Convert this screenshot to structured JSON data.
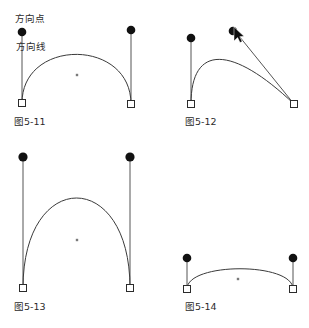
{
  "figure": {
    "background_color": "#ffffff",
    "width": 309,
    "height": 328,
    "colors": {
      "curve": "#3a3a3a",
      "handle_line": "#555555",
      "direction_point": "#111111",
      "anchor_square_fill": "#ffffff",
      "anchor_square_stroke": "#2b2b2b",
      "center_dot": "#7a7a7a",
      "text": "#2b2b2b"
    },
    "annotations": {
      "direction_point_label": "方向点",
      "direction_line_label": "方向线"
    },
    "panels": [
      {
        "id": "panel-5-11",
        "caption": "图5-11",
        "caption_x": 14,
        "caption_y": 125,
        "anchors": [
          {
            "name": "left-anchor",
            "x": 22,
            "y": 103
          },
          {
            "name": "right-anchor",
            "x": 131,
            "y": 104
          }
        ],
        "direction_points": [
          {
            "name": "left-direction-point",
            "x": 22,
            "y": 32
          },
          {
            "name": "right-direction-point",
            "x": 131,
            "y": 30
          }
        ],
        "handles": [
          {
            "x1": 22,
            "y1": 103,
            "x2": 22,
            "y2": 32
          },
          {
            "x1": 131,
            "y1": 104,
            "x2": 131,
            "y2": 30
          }
        ],
        "curve": "M 22 103 C 22 38 131 38 131 104",
        "center_dot": {
          "x": 77,
          "y": 75
        },
        "has_cursor": false
      },
      {
        "id": "panel-5-12",
        "caption": "图5-12",
        "caption_x": 185,
        "caption_y": 125,
        "anchors": [
          {
            "name": "left-anchor",
            "x": 191,
            "y": 104
          },
          {
            "name": "right-anchor",
            "x": 294,
            "y": 104
          }
        ],
        "direction_points": [
          {
            "name": "left-direction-point",
            "x": 191,
            "y": 38
          },
          {
            "name": "right-direction-point",
            "x": 235,
            "y": 31
          }
        ],
        "handles": [
          {
            "x1": 191,
            "y1": 104,
            "x2": 191,
            "y2": 38
          },
          {
            "x1": 294,
            "y1": 104,
            "x2": 235,
            "y2": 31
          }
        ],
        "curve": "M 191 104 C 191 44 232 45 294 104",
        "center_dot": null,
        "has_cursor": true,
        "cursor": {
          "x": 236,
          "y": 30,
          "name": "mouse-cursor-icon"
        }
      },
      {
        "id": "panel-5-13",
        "caption": "图5-13",
        "caption_x": 14,
        "caption_y": 310,
        "anchors": [
          {
            "name": "left-anchor",
            "x": 23,
            "y": 288
          },
          {
            "name": "right-anchor",
            "x": 130,
            "y": 288
          }
        ],
        "direction_points": [
          {
            "name": "left-direction-point",
            "x": 23,
            "y": 157
          },
          {
            "name": "right-direction-point",
            "x": 130,
            "y": 157
          }
        ],
        "handles": [
          {
            "x1": 23,
            "y1": 288,
            "x2": 23,
            "y2": 157
          },
          {
            "x1": 130,
            "y1": 288,
            "x2": 130,
            "y2": 157
          }
        ],
        "curve": "M 23 288 C 23 168 130 168 130 288",
        "center_dot": {
          "x": 77,
          "y": 240
        },
        "has_cursor": false
      },
      {
        "id": "panel-5-14",
        "caption": "图5-14",
        "caption_x": 185,
        "caption_y": 310,
        "anchors": [
          {
            "name": "left-anchor",
            "x": 187,
            "y": 289
          },
          {
            "name": "right-anchor",
            "x": 293,
            "y": 289
          }
        ],
        "direction_points": [
          {
            "name": "left-direction-point",
            "x": 187,
            "y": 258
          },
          {
            "name": "right-direction-point",
            "x": 293,
            "y": 258
          }
        ],
        "handles": [
          {
            "x1": 187,
            "y1": 289,
            "x2": 187,
            "y2": 258
          },
          {
            "x1": 293,
            "y1": 289,
            "x2": 293,
            "y2": 258
          }
        ],
        "curve": "M 187 289 C 187 262 293 262 293 289",
        "center_dot": {
          "x": 238,
          "y": 279
        },
        "has_cursor": false
      }
    ]
  }
}
